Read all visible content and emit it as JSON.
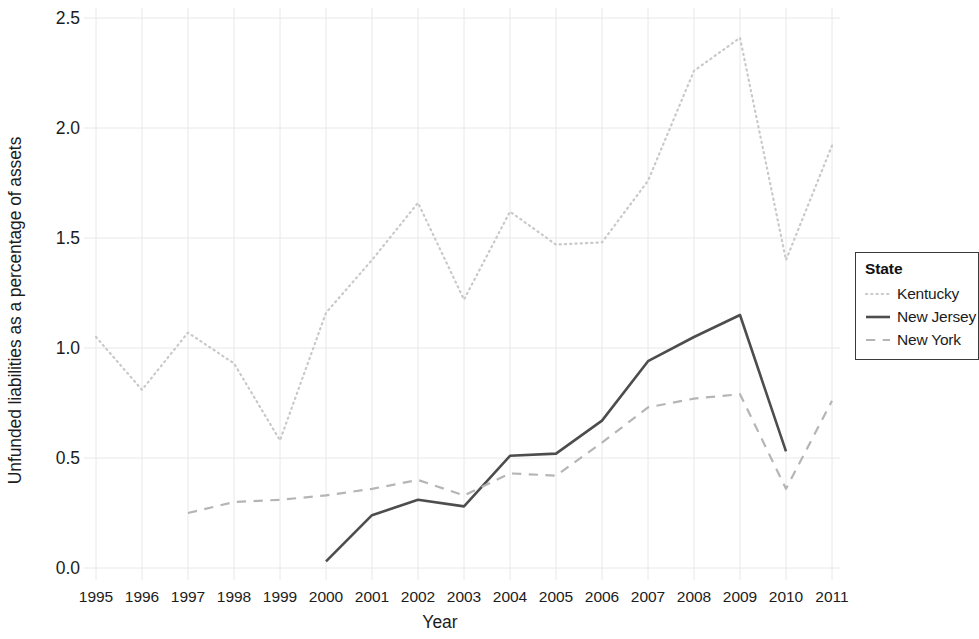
{
  "chart_data": {
    "type": "line",
    "title": "",
    "xlabel": "Year",
    "ylabel": "Unfunded liabilities as a percentage of assets",
    "x": [
      1995,
      1996,
      1997,
      1998,
      1999,
      2000,
      2001,
      2002,
      2003,
      2004,
      2005,
      2006,
      2007,
      2008,
      2009,
      2010,
      2011
    ],
    "xlim": [
      1995,
      2011
    ],
    "ylim": [
      0.0,
      2.5
    ],
    "yticks": [
      0.0,
      0.5,
      1.0,
      1.5,
      2.0,
      2.5
    ],
    "ytick_labels": [
      "0.0",
      "0.5",
      "1.0",
      "1.5",
      "2.0",
      "2.5"
    ],
    "xtick_labels": [
      "1995",
      "1996",
      "1997",
      "1998",
      "1999",
      "2000",
      "2001",
      "2002",
      "2003",
      "2004",
      "2005",
      "2006",
      "2007",
      "2008",
      "2009",
      "2010",
      "2011"
    ],
    "grid": true,
    "grid_color": "#e8e8e8",
    "legend_position": "right",
    "legend_title": "State",
    "series": [
      {
        "name": "Kentucky",
        "style": "dotted",
        "color": "#c9c9c9",
        "x": [
          1995,
          1996,
          1997,
          1998,
          1999,
          2000,
          2001,
          2002,
          2003,
          2004,
          2005,
          2006,
          2007,
          2008,
          2009,
          2010,
          2011
        ],
        "values": [
          1.05,
          0.81,
          1.07,
          0.93,
          0.58,
          1.16,
          1.4,
          1.66,
          1.22,
          1.62,
          1.47,
          1.48,
          1.76,
          2.26,
          2.41,
          1.4,
          1.92
        ]
      },
      {
        "name": "New Jersey",
        "style": "solid",
        "color": "#4d4d4d",
        "x": [
          2000,
          2001,
          2002,
          2003,
          2004,
          2005,
          2006,
          2007,
          2008,
          2009,
          2010
        ],
        "values": [
          0.03,
          0.24,
          0.31,
          0.28,
          0.51,
          0.52,
          0.67,
          0.94,
          1.05,
          1.15,
          0.53
        ]
      },
      {
        "name": "New York",
        "style": "dashed",
        "color": "#b5b5b5",
        "x": [
          1997,
          1998,
          1999,
          2000,
          2001,
          2002,
          2003,
          2004,
          2005,
          2006,
          2007,
          2008,
          2009,
          2010,
          2011
        ],
        "values": [
          0.25,
          0.3,
          0.31,
          0.33,
          0.36,
          0.4,
          0.33,
          0.43,
          0.42,
          0.57,
          0.73,
          0.77,
          0.79,
          0.36,
          0.76
        ]
      }
    ]
  },
  "legend": {
    "title": "State",
    "entries": [
      {
        "label": "Kentucky"
      },
      {
        "label": "New Jersey"
      },
      {
        "label": "New York"
      }
    ]
  },
  "axes": {
    "x_title": "Year",
    "y_title": "Unfunded liabilities as a percentage of assets"
  }
}
